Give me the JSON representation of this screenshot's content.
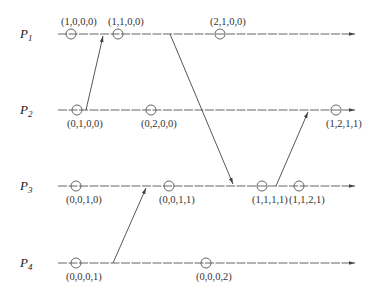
{
  "diagram": {
    "type": "space-time diagram (vector clocks)",
    "processes": [
      {
        "id": "P1",
        "name": "P",
        "sub": "1",
        "y": 34
      },
      {
        "id": "P2",
        "name": "P",
        "sub": "2",
        "y": 110
      },
      {
        "id": "P3",
        "name": "P",
        "sub": "3",
        "y": 186
      },
      {
        "id": "P4",
        "name": "P",
        "sub": "4",
        "y": 263
      }
    ],
    "events": [
      {
        "process": "P1",
        "x": 71,
        "label": "(1,0,0,0)",
        "label_pos": "above"
      },
      {
        "process": "P1",
        "x": 118,
        "label": "(1,1,0,0)",
        "label_pos": "above"
      },
      {
        "process": "P1",
        "x": 220,
        "label": "(2,1,0,0)",
        "label_pos": "above"
      },
      {
        "process": "P2",
        "x": 77,
        "label": "(0,1,0,0)",
        "label_pos": "below"
      },
      {
        "process": "P2",
        "x": 151,
        "label": "(0,2,0,0)",
        "label_pos": "below"
      },
      {
        "process": "P2",
        "x": 336,
        "label": "(1,2,1,1)",
        "label_pos": "below"
      },
      {
        "process": "P3",
        "x": 76,
        "label": "(0,0,1,0)",
        "label_pos": "below"
      },
      {
        "process": "P3",
        "x": 169,
        "label": "(0,0,1,1)",
        "label_pos": "below"
      },
      {
        "process": "P3",
        "x": 262,
        "label": "(1,1,1,1)",
        "label_pos": "below"
      },
      {
        "process": "P3",
        "x": 299,
        "label": "(1,1,2,1)",
        "label_pos": "below"
      },
      {
        "process": "P4",
        "x": 76,
        "label": "(0,0,0,1)",
        "label_pos": "below"
      },
      {
        "process": "P4",
        "x": 206,
        "label": "(0,0,0,2)",
        "label_pos": "below"
      }
    ],
    "messages": [
      {
        "from": "P2",
        "to": "P1",
        "x1": 86,
        "x2": 103
      },
      {
        "from": "P1",
        "to": "P3",
        "x1": 170,
        "x2": 233
      },
      {
        "from": "P4",
        "to": "P3",
        "x1": 113,
        "x2": 146
      },
      {
        "from": "P3",
        "to": "P2",
        "x1": 276,
        "x2": 308
      }
    ]
  }
}
